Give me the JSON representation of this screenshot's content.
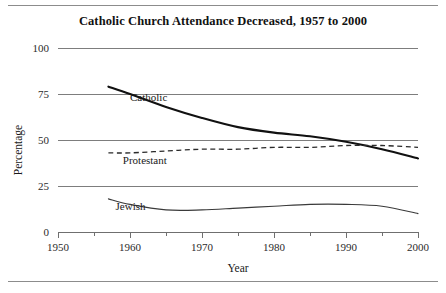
{
  "chart_data": {
    "type": "line",
    "title": "Catholic Church Attendance Decreased, 1957 to 2000",
    "xlabel": "Year",
    "ylabel": "Percentage",
    "xlim": [
      1950,
      2000
    ],
    "ylim": [
      0,
      100
    ],
    "xticks": [
      1950,
      1960,
      1970,
      1980,
      1990,
      2000
    ],
    "xtick_labels": [
      "1950",
      "1960",
      "1970",
      "1980",
      "1990",
      "2000"
    ],
    "xminor_ticks": [
      1955,
      1965,
      1975,
      1985,
      1995
    ],
    "yticks": [
      0,
      25,
      50,
      75,
      100
    ],
    "ytick_labels": [
      "0",
      "25",
      "50",
      "75",
      "100"
    ],
    "grid": "horizontal gridlines at each y tick",
    "legend": "inline labels beside each series",
    "series": [
      {
        "name": "Catholic",
        "style": "solid-thick",
        "label_x": 1960,
        "label_y": 71,
        "x": [
          1957,
          1960,
          1965,
          1970,
          1975,
          1980,
          1985,
          1990,
          1995,
          2000
        ],
        "values": [
          79,
          75,
          68,
          62,
          57,
          54,
          52,
          49,
          45,
          40
        ]
      },
      {
        "name": "Protestant",
        "style": "dashed",
        "label_x": 1959,
        "label_y": 37,
        "x": [
          1957,
          1960,
          1965,
          1970,
          1975,
          1980,
          1985,
          1990,
          1995,
          2000
        ],
        "values": [
          43,
          43,
          44,
          45,
          45,
          46,
          46,
          47,
          47,
          46
        ]
      },
      {
        "name": "Jewish",
        "style": "solid-thin",
        "label_x": 1958,
        "label_y": 12,
        "x": [
          1957,
          1960,
          1965,
          1970,
          1975,
          1980,
          1985,
          1990,
          1995,
          2000
        ],
        "values": [
          18,
          15,
          12,
          12,
          13,
          14,
          15,
          15,
          14,
          10
        ]
      }
    ]
  }
}
